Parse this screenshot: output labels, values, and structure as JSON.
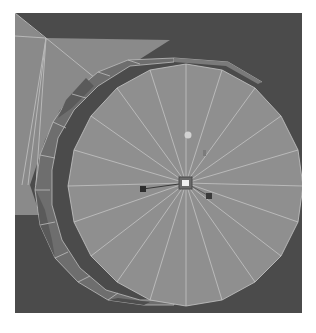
{
  "viewport": {
    "label": "3D viewport",
    "background": "#4b4b4b",
    "object": {
      "type": "cylinder",
      "display": "wireframe-on-shaded",
      "cap_segments": 20,
      "face_color": "#8e8e8e",
      "rim_color": "#6f6f6f",
      "rim_dark_color": "#5c5c5c",
      "wire_color": "#bdbdbd"
    },
    "manipulator": {
      "type": "move",
      "center_color": "#e8e8e8",
      "handle_top_color": "#cfcfcf",
      "handle_left_color": "#2e2e2e",
      "handle_right_color": "#3a3a3a"
    }
  }
}
